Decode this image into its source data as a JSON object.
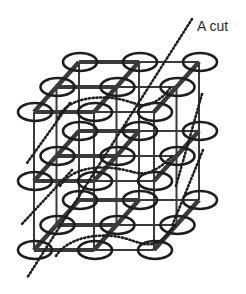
{
  "diagram": {
    "label": "A cut",
    "colors": {
      "line": "#3a3a3a",
      "node": "#1e1e1e",
      "dots": "#1e1e1e",
      "background": "#ffffff"
    },
    "lattice": {
      "layers": 3,
      "rows_per_layer": 3,
      "cols_per_row": 3,
      "node_shape": "ellipse"
    }
  }
}
